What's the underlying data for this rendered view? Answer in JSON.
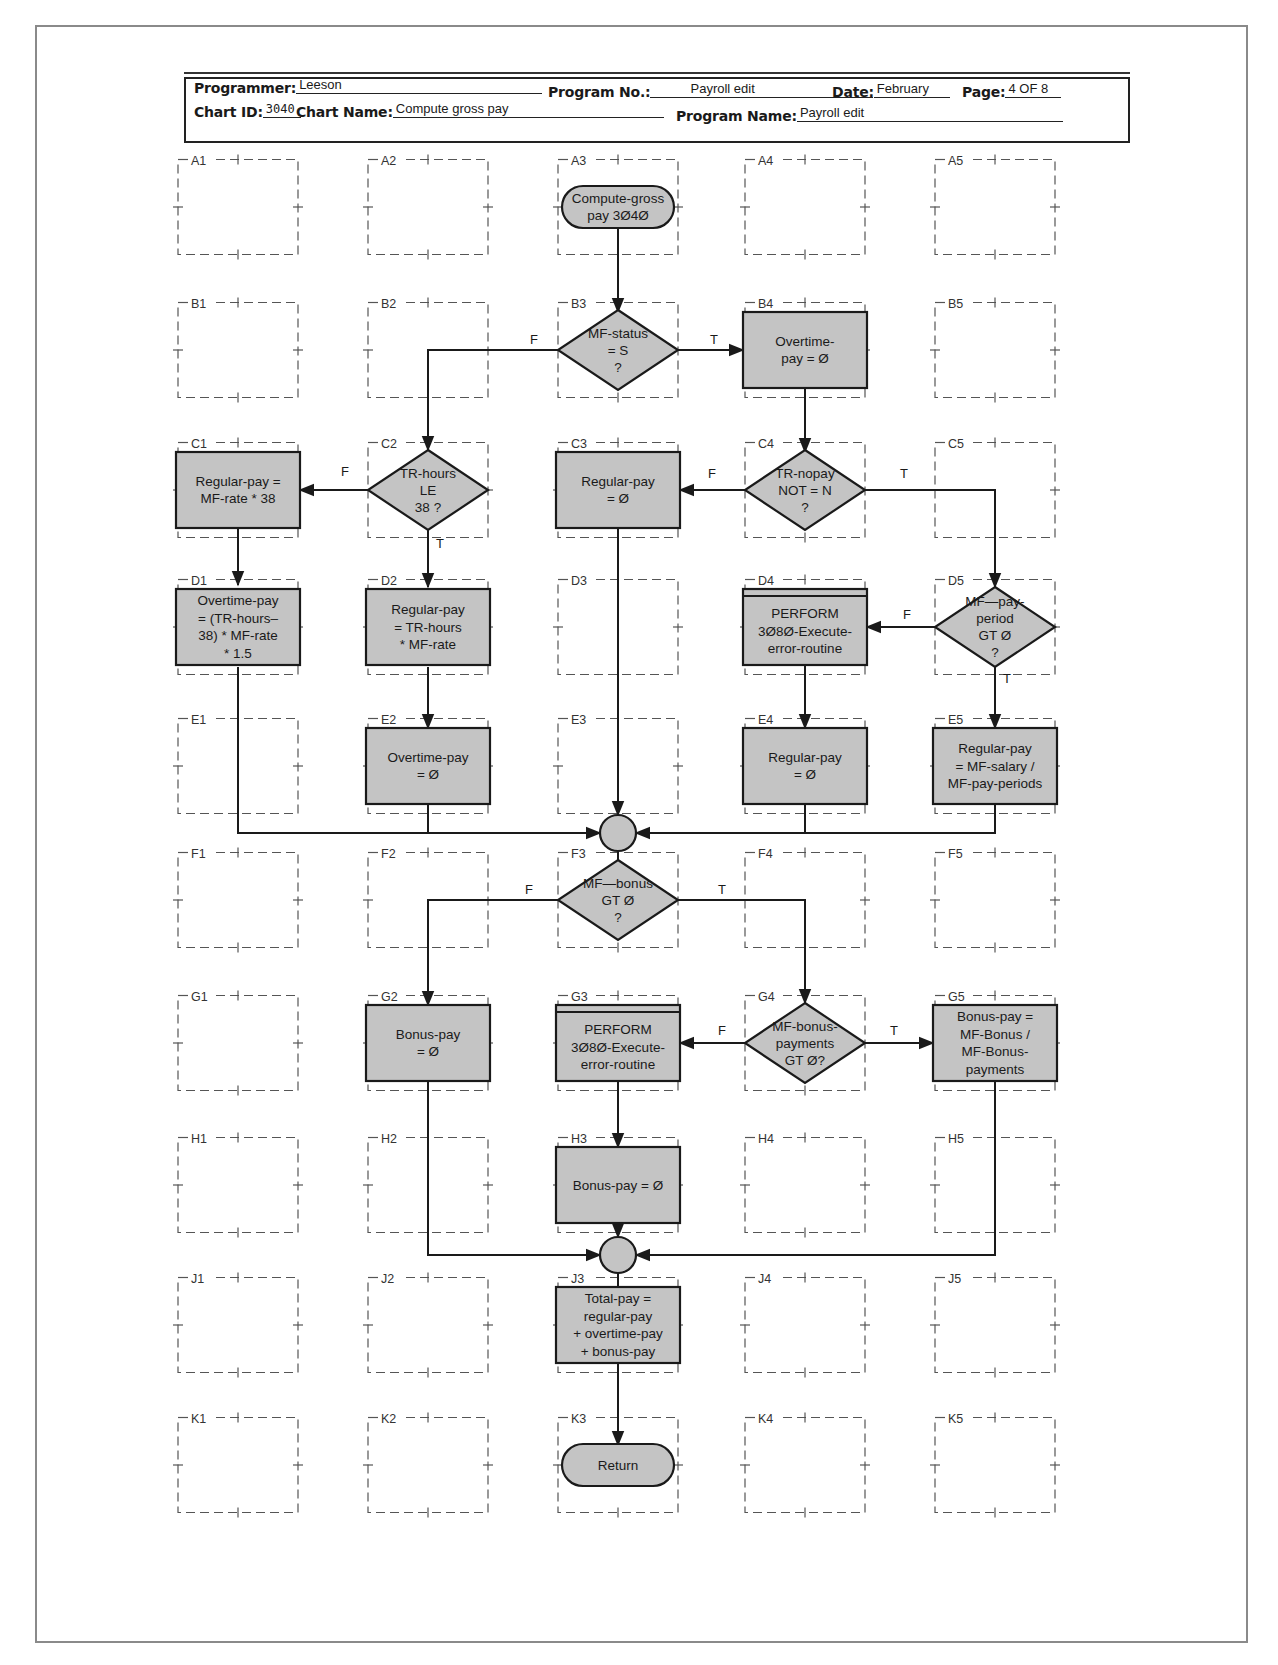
{
  "header": {
    "programmer_label": "Programmer:",
    "programmer": "Leeson",
    "program_no_label": "Program No.:",
    "program_no": "Payroll edit",
    "date_label": "Date:",
    "date": "February",
    "page_label": "Page:",
    "page": "4 OF 8",
    "chart_id_label": "Chart ID:",
    "chart_id": "3040",
    "chart_name_label": "Chart Name:",
    "chart_name": "Compute gross pay",
    "program_name_label": "Program Name:",
    "program_name": "Payroll edit"
  },
  "colors": {
    "symbol_fill": "#c4c4c4",
    "line": "#1a1a1a",
    "grid_dash": "#555555",
    "frame": "#8a8a8a"
  },
  "grid": {
    "rows": [
      "A",
      "B",
      "C",
      "D",
      "E",
      "F",
      "G",
      "H",
      "J",
      "K"
    ],
    "cols": [
      "1",
      "2",
      "3",
      "4",
      "5"
    ]
  },
  "nodes": {
    "A3": {
      "type": "terminal",
      "lines": [
        "Compute-gross",
        "pay 3040"
      ]
    },
    "B3": {
      "type": "decision",
      "lines": [
        "MF-status",
        "= S",
        "?"
      ]
    },
    "B4": {
      "type": "process",
      "lines": [
        "Overtime-",
        "pay = 0"
      ]
    },
    "C1": {
      "type": "process",
      "lines": [
        "Regular-pay =",
        "MF-rate * 38"
      ]
    },
    "C2": {
      "type": "decision",
      "lines": [
        "TR-hours",
        "LE",
        "38 ?"
      ]
    },
    "C3": {
      "type": "process",
      "lines": [
        "Regular-pay",
        "= 0"
      ]
    },
    "C4": {
      "type": "decision",
      "lines": [
        "TR-nopay",
        "NOT = N",
        "?"
      ]
    },
    "D1": {
      "type": "process",
      "lines": [
        "Overtime-pay",
        "= (TR-hours–",
        "38) * MF-rate",
        "* 1.5"
      ]
    },
    "D2": {
      "type": "process",
      "lines": [
        "Regular-pay",
        "= TR-hours",
        "* MF-rate"
      ]
    },
    "D4": {
      "type": "predefined",
      "lines": [
        "PERFORM",
        "3080-Execute-",
        "error-routine"
      ]
    },
    "D5": {
      "type": "decision",
      "lines": [
        "MF—pay-",
        "period",
        "GT 0",
        "?"
      ]
    },
    "E2": {
      "type": "process",
      "lines": [
        "Overtime-pay",
        "= 0"
      ]
    },
    "E4": {
      "type": "process",
      "lines": [
        "Regular-pay",
        "= 0"
      ]
    },
    "E5": {
      "type": "process",
      "lines": [
        "Regular-pay",
        "= MF-salary /",
        "MF-pay-periods"
      ]
    },
    "F3": {
      "type": "decision",
      "lines": [
        "MF—bonus",
        "GT 0",
        "?"
      ]
    },
    "G2": {
      "type": "process",
      "lines": [
        "Bonus-pay",
        "= 0"
      ]
    },
    "G3": {
      "type": "predefined",
      "lines": [
        "PERFORM",
        "3080-Execute-",
        "error-routine"
      ]
    },
    "G4": {
      "type": "decision",
      "lines": [
        "MF-bonus-",
        "payments",
        "GT 0?"
      ]
    },
    "G5": {
      "type": "process",
      "lines": [
        "Bonus-pay =",
        "MF-Bonus /",
        "MF-Bonus-",
        "payments"
      ]
    },
    "H3": {
      "type": "process",
      "lines": [
        "Bonus-pay = 0"
      ]
    },
    "J3": {
      "type": "process",
      "lines": [
        "Total-pay =",
        "regular-pay",
        "+ overtime-pay",
        "+ bonus-pay"
      ]
    },
    "K3": {
      "type": "terminal",
      "lines": [
        "Return"
      ]
    }
  },
  "edge_labels": {
    "b3_false": "F",
    "b3_true": "T",
    "c2_false": "F",
    "c2_true": "T",
    "c4_false": "F",
    "c4_true": "T",
    "d5_false": "F",
    "d5_true": "T",
    "f3_false": "F",
    "f3_true": "T",
    "g4_false": "F",
    "g4_true": "T"
  }
}
